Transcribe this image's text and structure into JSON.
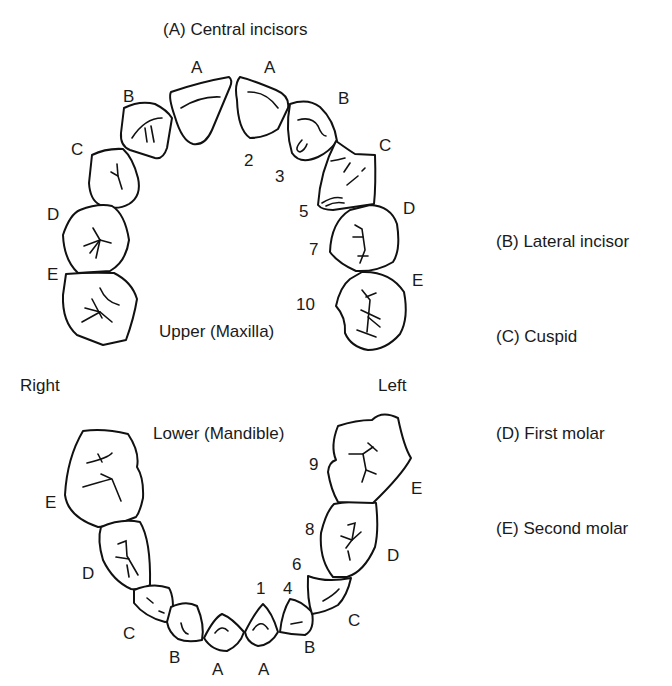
{
  "title": "(A) Central incisors",
  "arches": {
    "upper": "Upper (Maxilla)",
    "lower": "Lower (Mandible)"
  },
  "sides": {
    "right": "Right",
    "left": "Left"
  },
  "legend": [
    {
      "key": "A",
      "label": "(A) Central incisors"
    },
    {
      "key": "B",
      "label": "(B) Lateral incisor"
    },
    {
      "key": "C",
      "label": "(C) Cuspid"
    },
    {
      "key": "D",
      "label": "(D) First molar"
    },
    {
      "key": "E",
      "label": "(E) Second molar"
    }
  ],
  "upper_tooth_letters": {
    "right": [
      "A",
      "B",
      "C",
      "D",
      "E"
    ],
    "left": [
      "A",
      "B",
      "C",
      "D",
      "E"
    ]
  },
  "lower_tooth_letters": {
    "right": [
      "A",
      "B",
      "C",
      "D",
      "E"
    ],
    "left": [
      "A",
      "B",
      "C",
      "D",
      "E"
    ]
  },
  "eruption_numbers": {
    "upper": [
      "2",
      "3",
      "5",
      "7",
      "10"
    ],
    "lower": [
      "1",
      "4",
      "6",
      "8",
      "9"
    ]
  }
}
